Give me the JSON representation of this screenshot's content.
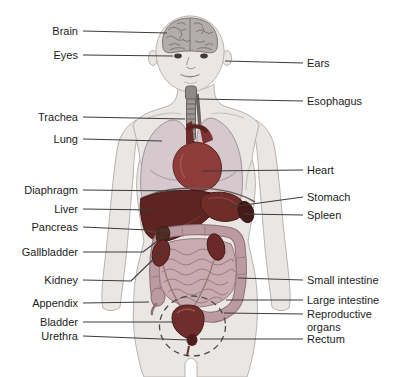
{
  "diagram": {
    "type": "human-anatomy-front-view",
    "background": "#ffffff"
  },
  "colors": {
    "body": "#e9e6e4",
    "body_outline": "#b8b3b0",
    "crease": "#c9c3c0",
    "brain": "#b2acac",
    "brain_line": "#716b6b",
    "trachea": "#9b9593",
    "trachea_dark": "#5e5957",
    "esophagus": "#6e6260",
    "lung": "#d5c9ce",
    "lung_outline": "#a2929a",
    "heart": "#8e3c39",
    "heart_dark": "#5a2220",
    "liver": "#5e2422",
    "liver_dark": "#3f1614",
    "stomach": "#6f2c29",
    "spleen": "#451b1a",
    "pancreas": "#a5845f",
    "gallbladder": "#4f2a20",
    "colon": "#bb9aa1",
    "colon_outline": "#8f6f76",
    "intestine": "#c8abb0",
    "intestine_line": "#9a7b81",
    "kidney": "#6b2a28",
    "ureter": "#9a7a76",
    "bladder": "#6f2d2b",
    "rectum": "#4f1d1b",
    "dashed": "#4a4a4a",
    "label_text": "#1c1c1c",
    "leader": "#3c3c3c"
  },
  "labels": {
    "left": [
      {
        "id": "brain",
        "text": "Brain",
        "line": [
          [
            83,
            31
          ],
          [
            167,
            33
          ]
        ]
      },
      {
        "id": "eyes",
        "text": "Eyes",
        "line": [
          [
            83,
            55
          ],
          [
            173,
            56
          ]
        ]
      },
      {
        "id": "trachea",
        "text": "Trachea",
        "line": [
          [
            83,
            117
          ],
          [
            185,
            119
          ]
        ]
      },
      {
        "id": "lung",
        "text": "Lung",
        "line": [
          [
            83,
            139
          ],
          [
            162,
            141
          ]
        ]
      },
      {
        "id": "diaphragm",
        "text": "Diaphragm",
        "line": [
          [
            83,
            190
          ],
          [
            178,
            191
          ]
        ]
      },
      {
        "id": "liver",
        "text": "Liver",
        "line": [
          [
            83,
            209
          ],
          [
            156,
            210
          ]
        ]
      },
      {
        "id": "pancreas",
        "text": "Pancreas",
        "line": [
          [
            83,
            227
          ],
          [
            170,
            231
          ]
        ]
      },
      {
        "id": "gallbladder",
        "text": "Gallbladder",
        "line": [
          [
            83,
            252
          ],
          [
            143,
            252
          ],
          [
            164,
            236
          ]
        ]
      },
      {
        "id": "kidney",
        "text": "Kidney",
        "line": [
          [
            83,
            280
          ],
          [
            131,
            281
          ],
          [
            168,
            245
          ]
        ]
      },
      {
        "id": "appendix",
        "text": "Appendix",
        "line": [
          [
            83,
            303
          ],
          [
            149,
            302
          ]
        ]
      },
      {
        "id": "bladder",
        "text": "Bladder",
        "line": [
          [
            83,
            322
          ],
          [
            177,
            322
          ]
        ]
      },
      {
        "id": "urethra",
        "text": "Urethra",
        "line": [
          [
            83,
            336
          ],
          [
            188,
            340
          ]
        ]
      }
    ],
    "right": [
      {
        "id": "ears",
        "text": "Ears",
        "line": [
          [
            303,
            63
          ],
          [
            225,
            61
          ]
        ]
      },
      {
        "id": "esophagus",
        "text": "Esophagus",
        "line": [
          [
            303,
            101
          ],
          [
            197,
            99
          ]
        ]
      },
      {
        "id": "heart",
        "text": "Heart",
        "line": [
          [
            303,
            170
          ],
          [
            202,
            171
          ]
        ]
      },
      {
        "id": "stomach",
        "text": "Stomach",
        "line": [
          [
            303,
            197
          ],
          [
            230,
            207
          ]
        ]
      },
      {
        "id": "spleen",
        "text": "Spleen",
        "line": [
          [
            303,
            215
          ],
          [
            244,
            214
          ]
        ]
      },
      {
        "id": "small-intestine",
        "text": "Small intestine",
        "line": [
          [
            303,
            280
          ],
          [
            238,
            278
          ]
        ]
      },
      {
        "id": "large-intestine",
        "text": "Large intestine",
        "line": [
          [
            303,
            300
          ],
          [
            226,
            300
          ]
        ]
      },
      {
        "id": "reproductive-organs",
        "text": "Reproductive organs",
        "lines": [
          "Reproductive",
          "organs"
        ],
        "line": [
          [
            303,
            314
          ],
          [
            224,
            313
          ]
        ]
      },
      {
        "id": "rectum",
        "text": "Rectum",
        "line": [
          [
            303,
            339
          ],
          [
            200,
            339
          ]
        ]
      }
    ]
  }
}
